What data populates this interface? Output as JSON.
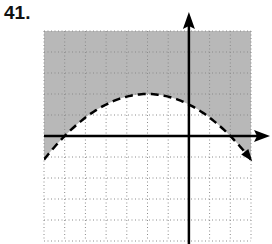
{
  "problem": {
    "number": "41."
  },
  "colors": {
    "shade": "#b8b8b8",
    "grid": "#8a8a8a",
    "axis": "#000000",
    "curve": "#000000",
    "background": "#ffffff"
  },
  "chart_data": {
    "type": "line",
    "title": "",
    "problem_label": "41.",
    "xlabel": "",
    "ylabel": "",
    "xlim": [
      -7,
      3
    ],
    "ylim": [
      -5,
      5
    ],
    "grid": true,
    "grid_style": "dotted",
    "grid_step": 1,
    "tick_labels": false,
    "axes_arrows": [
      "positive-x",
      "positive-y"
    ],
    "series": [
      {
        "name": "boundary parabola",
        "equation": "y = -(1/8)(x + 2)^2 + 2",
        "style": "dashed",
        "vertex": [
          -2,
          2
        ],
        "x_intercepts": [
          -6,
          2
        ],
        "x": [
          -7,
          -6,
          -5,
          -4,
          -3,
          -2,
          -1,
          0,
          1,
          2,
          3
        ],
        "y": [
          -1.125,
          0,
          0.875,
          1.5,
          1.875,
          2,
          1.875,
          1.5,
          0.875,
          0,
          -1.125
        ]
      }
    ],
    "shaded_region": "above curve (y > -(1/8)(x + 2)^2 + 2)",
    "inequality": "y > -(1/8)(x + 2)^2 + 2"
  }
}
